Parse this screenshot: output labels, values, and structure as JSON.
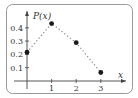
{
  "chart_data": {
    "type": "scatter",
    "title": "",
    "xlabel": "x",
    "ylabel": "P(x)",
    "x": [
      0,
      1,
      2,
      3
    ],
    "values": [
      0.216,
      0.432,
      0.288,
      0.064
    ],
    "connector": "dotted",
    "xlim": [
      0,
      3.4
    ],
    "ylim": [
      0,
      0.47
    ],
    "xticks": [
      "1",
      "2",
      "3"
    ],
    "yticks": [
      "0.1",
      "0.2",
      "0.3",
      "0.4"
    ],
    "grid": false,
    "legend": "none",
    "colors": {
      "points": "#1a1a1a",
      "line": "#888888",
      "axis": "#444444",
      "frame": "#999999"
    }
  }
}
